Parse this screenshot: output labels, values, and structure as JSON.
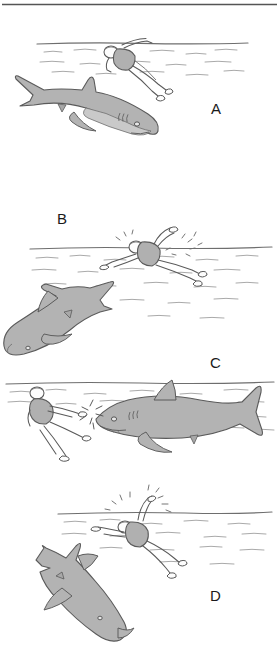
{
  "figure": {
    "panel_count": 4,
    "palette": {
      "background": "#ffffff",
      "ink": "#5a5a5a",
      "ink_dark": "#3d3d3d",
      "shark_fill": "#b3b3b3",
      "shark_belly": "#c9c9c9",
      "swimsuit_fill": "#b0b0b0",
      "skin_fill": "#fdfdfd",
      "water_line": "#6e6e6e",
      "label_color": "#1a1a1a",
      "top_rule": "#555555"
    }
  },
  "panels": [
    {
      "id": "panel-a",
      "label": "A",
      "caption": "Swimmer floats at the surface while a large shark cruises beneath, approaching from the left.",
      "waterline_y": 44,
      "shark": {
        "facing": "right",
        "attitude": "level-cruise",
        "position": "lower-left"
      },
      "swimmer": {
        "pose": "face-down-float",
        "position": "upper-center",
        "splash": false
      }
    },
    {
      "id": "panel-b",
      "label": "B",
      "caption": "Swimmer thrashes at the surface; the shark turns and dives away down-left.",
      "waterline_y": 247,
      "shark": {
        "facing": "left",
        "attitude": "diving-down-left",
        "position": "lower-left"
      },
      "swimmer": {
        "pose": "arm-raised-thrashing",
        "position": "center-right",
        "splash": true
      }
    },
    {
      "id": "panel-c",
      "label": "C",
      "caption": "Shark closes head-on from the right; swimmer strikes its snout, impact marks shown.",
      "waterline_y": 382,
      "shark": {
        "facing": "left",
        "attitude": "level-charge",
        "position": "center-right"
      },
      "swimmer": {
        "pose": "upright-kicking-striking",
        "position": "left",
        "splash": true
      }
    },
    {
      "id": "panel-d",
      "label": "D",
      "caption": "Swimmer swims away at the surface as the shark departs downward to the lower left.",
      "waterline_y": 512,
      "shark": {
        "facing": "left",
        "attitude": "departing-down-left",
        "position": "lower-left"
      },
      "swimmer": {
        "pose": "front-crawl-fleeing",
        "position": "upper-center",
        "splash": true
      }
    }
  ]
}
